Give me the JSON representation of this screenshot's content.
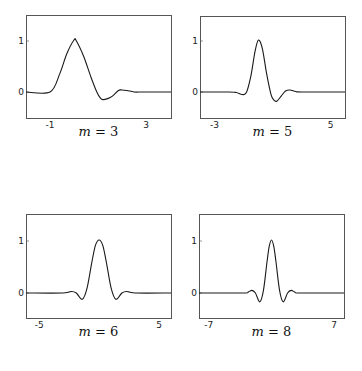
{
  "chart_data": [
    {
      "type": "line",
      "title": "m = 3",
      "caption_var": "m",
      "caption_val": "3",
      "xlabel": "",
      "ylabel": "",
      "xlim": [
        -2,
        4.04
      ],
      "ylim": [
        -0.5,
        1.5
      ],
      "xticks": [
        -1,
        3
      ],
      "yticks": [
        0,
        1
      ],
      "grid": false,
      "x": [
        -2,
        -1.0,
        -0.6,
        -0.3,
        0.0,
        0.1,
        0.4,
        0.7,
        0.95,
        1.1,
        1.2,
        1.4,
        1.6,
        1.85,
        2.0,
        2.2,
        2.5,
        2.8,
        3.2,
        4.04
      ],
      "y": [
        0,
        0,
        0.35,
        0.75,
        1.02,
        1.0,
        0.7,
        0.3,
        0.0,
        -0.12,
        -0.15,
        -0.13,
        -0.08,
        0.03,
        0.04,
        0.03,
        0.0,
        0.0,
        0.0,
        0.0
      ]
    },
    {
      "type": "line",
      "title": "m = 5",
      "caption_var": "m",
      "caption_val": "5",
      "xlabel": "",
      "ylabel": "",
      "xlim": [
        -4,
        6
      ],
      "ylim": [
        -0.5,
        1.5
      ],
      "xticks": [
        -3,
        5
      ],
      "yticks": [
        0,
        1
      ],
      "grid": false,
      "x": [
        -4,
        -2.0,
        -1.5,
        -1.1,
        -0.8,
        -0.5,
        -0.2,
        0.03,
        0.3,
        0.6,
        0.9,
        1.1,
        1.3,
        1.6,
        1.9,
        2.2,
        2.6,
        3.0,
        6
      ],
      "y": [
        0,
        0,
        -0.01,
        -0.05,
        -0.01,
        0.3,
        0.8,
        1.02,
        0.85,
        0.35,
        -0.05,
        -0.16,
        -0.18,
        -0.08,
        0.02,
        0.04,
        0.01,
        0.0,
        0.0
      ]
    },
    {
      "type": "line",
      "title": "m = 6",
      "caption_var": "m",
      "caption_val": "6",
      "xlabel": "",
      "ylabel": "",
      "xlim": [
        -6.1,
        6
      ],
      "ylim": [
        -0.5,
        1.5
      ],
      "xticks": [
        -5,
        5
      ],
      "yticks": [
        0,
        1
      ],
      "grid": false,
      "x": [
        -6.1,
        -3.0,
        -2.3,
        -1.9,
        -1.4,
        -1.0,
        -0.6,
        -0.3,
        0,
        0.3,
        0.6,
        1.0,
        1.4,
        1.9,
        2.3,
        3.0,
        6
      ],
      "y": [
        0,
        0,
        0.03,
        0.0,
        -0.12,
        0.1,
        0.6,
        0.92,
        1.02,
        0.92,
        0.6,
        0.1,
        -0.12,
        0.0,
        0.03,
        0.0,
        0.0
      ]
    },
    {
      "type": "line",
      "title": "m = 8",
      "caption_var": "m",
      "caption_val": "8",
      "xlabel": "",
      "ylabel": "",
      "xlim": [
        -8.1,
        8.1
      ],
      "ylim": [
        -0.5,
        1.5
      ],
      "xticks": [
        -7,
        7
      ],
      "yticks": [
        0,
        1
      ],
      "grid": false,
      "x": [
        -8.1,
        -3.2,
        -2.6,
        -2.2,
        -1.8,
        -1.3,
        -0.9,
        -0.5,
        -0.25,
        0,
        0.25,
        0.5,
        0.9,
        1.3,
        1.8,
        2.2,
        2.6,
        3.2,
        8.1
      ],
      "y": [
        0,
        0,
        0.02,
        0.05,
        0.0,
        -0.17,
        0.05,
        0.6,
        0.9,
        1.02,
        0.9,
        0.6,
        0.05,
        -0.17,
        0.0,
        0.05,
        0.02,
        0.0,
        0.0
      ]
    }
  ],
  "layout": {
    "panels": [
      {
        "left": 26,
        "top": 15,
        "width": 145,
        "height": 103,
        "zero_y": 92,
        "one_y": 41,
        "caption_top": 124
      },
      {
        "left": 200,
        "top": 16,
        "width": 145,
        "height": 102,
        "zero_y": 92,
        "one_y": 41,
        "caption_top": 124
      },
      {
        "left": 26,
        "top": 214,
        "width": 145,
        "height": 104,
        "zero_y": 293,
        "one_y": 241,
        "caption_top": 324
      },
      {
        "left": 199,
        "top": 214,
        "width": 145,
        "height": 104,
        "zero_y": 293,
        "one_y": 241,
        "caption_top": 324
      }
    ],
    "line_color": "#1a1a1a",
    "frame_color": "#555555"
  }
}
